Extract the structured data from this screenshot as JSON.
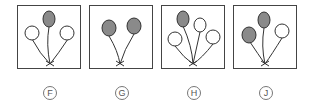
{
  "colors": {
    "filled": "#8a8a8a",
    "outline": "#333333",
    "empty": "#ffffff"
  },
  "options": [
    {
      "label": "F",
      "balloons": [
        {
          "fill": "gray"
        },
        {
          "fill": "white"
        },
        {
          "fill": "white"
        }
      ]
    },
    {
      "label": "G",
      "balloons": [
        {
          "fill": "gray"
        },
        {
          "fill": "gray"
        }
      ]
    },
    {
      "label": "H",
      "balloons": [
        {
          "fill": "gray"
        },
        {
          "fill": "white"
        },
        {
          "fill": "white"
        },
        {
          "fill": "white"
        }
      ]
    },
    {
      "label": "J",
      "balloons": [
        {
          "fill": "gray"
        },
        {
          "fill": "gray"
        },
        {
          "fill": "white"
        }
      ]
    }
  ]
}
